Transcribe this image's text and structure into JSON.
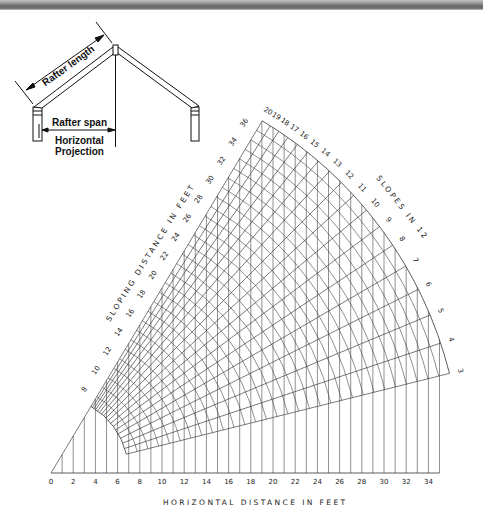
{
  "header_bar": {
    "color_top": "#c4c4c4",
    "color_mid": "#666666"
  },
  "house_diagram": {
    "rafter_length_label": "Rafter length",
    "rafter_span_label": "Rafter span",
    "projection_label_line1": "Horizontal",
    "projection_label_line2": "Projection"
  },
  "chart_data": {
    "type": "nomogram",
    "xlabel": "HORIZONTAL DISTANCE IN FEET",
    "sloping_label": "SLOPING DISTANCE IN FEET",
    "slopes_label": "SLOPES IN 12",
    "x_ticks": [
      0,
      2,
      4,
      6,
      8,
      10,
      12,
      14,
      16,
      18,
      20,
      22,
      24,
      26,
      28,
      30,
      32,
      34
    ],
    "x_range": [
      0,
      35
    ],
    "sloping_ticks": [
      8,
      10,
      12,
      14,
      16,
      18,
      20,
      22,
      24,
      26,
      28,
      30,
      32,
      34,
      36
    ],
    "sloping_range": [
      7,
      37
    ],
    "slopes_in_12": [
      3,
      4,
      5,
      6,
      7,
      8,
      9,
      10,
      11,
      12,
      13,
      14,
      15,
      16,
      17,
      18,
      19,
      20
    ],
    "grid": {
      "vertical_step_ft": 1,
      "arc_step_ft": 1
    },
    "line_color": "#333333"
  }
}
